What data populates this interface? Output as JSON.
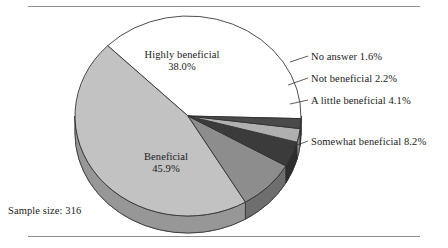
{
  "figure": {
    "sample_size_text": "Sample size: 316",
    "background": "#ffffff",
    "rule_color": "#8d8d8d"
  },
  "chart_data": {
    "type": "pie",
    "title": "",
    "xlabel": "",
    "ylabel": "",
    "legend_position": "callout-labels",
    "grid": false,
    "sample_size": 316,
    "units": "percent",
    "categories": [
      "Highly beneficial",
      "Beneficial",
      "Somewhat beneficial",
      "A little beneficial",
      "Not beneficial",
      "No answer"
    ],
    "values": [
      38.0,
      45.9,
      8.2,
      4.1,
      2.2,
      1.6
    ],
    "slices": [
      {
        "label": "Highly beneficial",
        "value": 38.0,
        "value_text": "38.0%",
        "color": "#ffffff",
        "label_placement": "inside"
      },
      {
        "label": "Beneficial",
        "value": 45.9,
        "value_text": "45.9%",
        "color": "#c2c2c2",
        "label_placement": "inside"
      },
      {
        "label": "Somewhat beneficial",
        "value": 8.2,
        "value_text": "8.2%",
        "color": "#8d8d8d",
        "label_placement": "callout-right"
      },
      {
        "label": "A little beneficial",
        "value": 4.1,
        "value_text": "4.1%",
        "color": "#3b3b3b",
        "label_placement": "callout-right"
      },
      {
        "label": "Not beneficial",
        "value": 2.2,
        "value_text": "2.2%",
        "color": "#b0b0b0",
        "label_placement": "callout-right"
      },
      {
        "label": "No answer",
        "value": 1.6,
        "value_text": "1.6%",
        "color": "#4a4a4a",
        "label_placement": "callout-right"
      }
    ]
  },
  "labels": {
    "highly_beneficial": {
      "name": "Highly beneficial",
      "pct": "38.0%"
    },
    "beneficial": {
      "name": "Beneficial",
      "pct": "45.9%"
    },
    "no_answer": {
      "text": "No answer 1.6%"
    },
    "not_beneficial": {
      "text": "Not beneficial 2.2%"
    },
    "a_little_beneficial": {
      "text": "A little beneficial 4.1%"
    },
    "somewhat_beneficial": {
      "text": "Somewhat beneficial 8.2%"
    }
  }
}
